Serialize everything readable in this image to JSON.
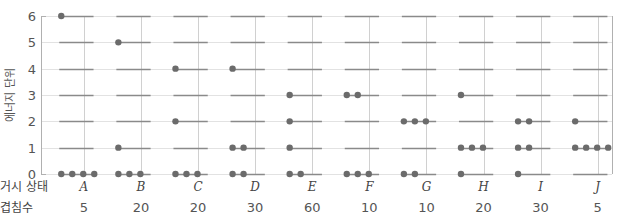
{
  "chart_data": {
    "type": "scatter",
    "title": "",
    "xlabel": "거시 상태",
    "ylabel": "에너지 단위",
    "row_labels": {
      "macrostate": "거시 상태",
      "multiplicity": "겹침수"
    },
    "yticks": [
      0,
      1,
      2,
      3,
      4,
      5,
      6
    ],
    "ylim": [
      0,
      6
    ],
    "grid": true,
    "categories": [
      "A",
      "B",
      "C",
      "D",
      "E",
      "F",
      "G",
      "H",
      "I",
      "J"
    ],
    "multiplicity": [
      5,
      20,
      20,
      30,
      60,
      10,
      10,
      20,
      30,
      5
    ],
    "occupancy_description": "Number of particles (dots) at each energy level for each macrostate; 4 particles, 6 energy units total",
    "levels": [
      0,
      1,
      2,
      3,
      4,
      5,
      6
    ],
    "occupancy": {
      "A": [
        4,
        0,
        0,
        0,
        0,
        0,
        1
      ],
      "B": [
        3,
        1,
        0,
        0,
        0,
        1,
        0
      ],
      "C": [
        3,
        0,
        1,
        0,
        1,
        0,
        0
      ],
      "D": [
        2,
        2,
        0,
        0,
        1,
        0,
        0
      ],
      "E": [
        2,
        1,
        1,
        1,
        0,
        0,
        0
      ],
      "F": [
        3,
        0,
        0,
        2,
        0,
        0,
        0
      ],
      "G": [
        2,
        0,
        3,
        0,
        0,
        0,
        0
      ],
      "H": [
        1,
        3,
        0,
        1,
        0,
        0,
        0
      ],
      "I": [
        1,
        2,
        2,
        0,
        0,
        0,
        0
      ],
      "J": [
        0,
        4,
        1,
        0,
        0,
        0,
        0
      ]
    },
    "colors": {
      "dot": "#6b6b6b",
      "level_line": "#8a8a8a",
      "gridline": "#d0d0d0",
      "axis": "#b0b0b0"
    }
  }
}
